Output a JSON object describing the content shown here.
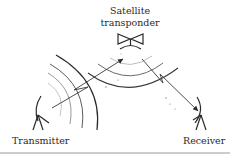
{
  "diagram": {
    "nodes": {
      "satellite": {
        "label_line1": "Satellite",
        "label_line2": "transponder",
        "icon": "bowtie-antenna-icon"
      },
      "transmitter": {
        "label": "Transmitter",
        "icon": "antenna-icon"
      },
      "receiver": {
        "label": "Receiver",
        "icon": "antenna-icon"
      }
    },
    "edges": [
      {
        "from": "transmitter",
        "to": "satellite",
        "style": "arrow with zigzag (uplink)"
      },
      {
        "from": "satellite",
        "to": "receiver",
        "style": "arrow with zigzag (downlink)"
      }
    ],
    "waves": [
      {
        "source": "transmitter",
        "count": 4,
        "direction": "toward satellite"
      },
      {
        "source": "satellite",
        "count": 3,
        "direction": "toward receiver"
      }
    ],
    "colors": {
      "ink": "#2a2a2a",
      "faint_wave": "#a8a8a8",
      "rule": "#9a9a9a"
    }
  }
}
